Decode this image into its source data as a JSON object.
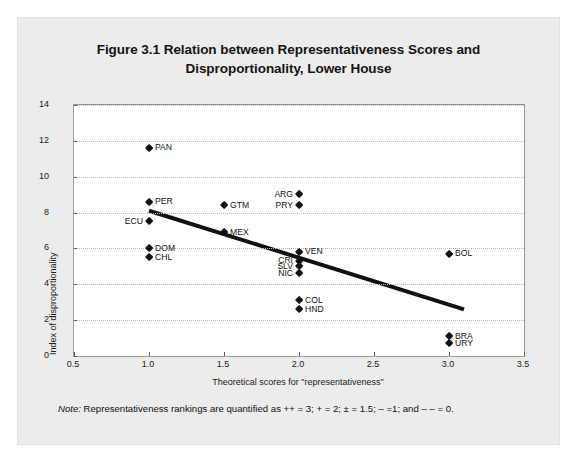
{
  "figure": {
    "title": "Figure 3.1 Relation between Representativeness Scores and Disproportionality, Lower House",
    "title_line1": "Figure 3.1 Relation between Representativeness Scores and",
    "title_line2": "Disproportionality, Lower House",
    "note_label": "Note:",
    "note_text": " Representativeness rankings are quantified as ++ = 3; + = 2; ± = 1.5; – =1; and – – = 0."
  },
  "chart_data": {
    "type": "scatter",
    "title": "Figure 3.1 Relation between Representativeness Scores and Disproportionality, Lower House",
    "xlabel": "Theoretical scores for \"representativeness\"",
    "ylabel": "Index of disproportionality",
    "xlim": [
      0.5,
      3.5
    ],
    "ylim": [
      0,
      14
    ],
    "xticks": [
      "0.5",
      "1.0",
      "1.5",
      "2.0",
      "2.5",
      "3.0",
      "3.5"
    ],
    "xtick_values": [
      0.5,
      1.0,
      1.5,
      2.0,
      2.5,
      3.0,
      3.5
    ],
    "yticks": [
      "0",
      "2",
      "4",
      "6",
      "8",
      "10",
      "12",
      "14"
    ],
    "ytick_values": [
      0,
      2,
      4,
      6,
      8,
      10,
      12,
      14
    ],
    "grid": "horizontal-dotted",
    "legend": "none",
    "points": [
      {
        "label": "PAN",
        "x": 1.0,
        "y": 11.6,
        "label_side": "right"
      },
      {
        "label": "PER",
        "x": 1.0,
        "y": 8.6,
        "label_side": "right"
      },
      {
        "label": "ECU",
        "x": 1.0,
        "y": 7.5,
        "label_side": "left"
      },
      {
        "label": "DOM",
        "x": 1.0,
        "y": 6.0,
        "label_side": "right"
      },
      {
        "label": "CHL",
        "x": 1.0,
        "y": 5.5,
        "label_side": "right"
      },
      {
        "label": "GTM",
        "x": 1.5,
        "y": 8.4,
        "label_side": "right"
      },
      {
        "label": "MEX",
        "x": 1.5,
        "y": 6.9,
        "label_side": "right"
      },
      {
        "label": "ARG",
        "x": 2.0,
        "y": 9.0,
        "label_side": "left"
      },
      {
        "label": "PRY",
        "x": 2.0,
        "y": 8.4,
        "label_side": "left"
      },
      {
        "label": "VEN",
        "x": 2.0,
        "y": 5.8,
        "label_side": "right"
      },
      {
        "label": "CRI",
        "x": 2.0,
        "y": 5.3,
        "label_side": "left"
      },
      {
        "label": "SLV",
        "x": 2.0,
        "y": 5.0,
        "label_side": "left"
      },
      {
        "label": "NIC",
        "x": 2.0,
        "y": 4.6,
        "label_side": "left"
      },
      {
        "label": "COL",
        "x": 2.0,
        "y": 3.1,
        "label_side": "right"
      },
      {
        "label": "HND",
        "x": 2.0,
        "y": 2.6,
        "label_side": "right"
      },
      {
        "label": "BOL",
        "x": 3.0,
        "y": 5.7,
        "label_side": "right"
      },
      {
        "label": "BRA",
        "x": 3.0,
        "y": 1.1,
        "label_side": "right"
      },
      {
        "label": "URY",
        "x": 3.0,
        "y": 0.7,
        "label_side": "right"
      }
    ],
    "trendline": {
      "x0": 1.0,
      "y0": 8.1,
      "x1": 3.1,
      "y1": 2.6,
      "color": "#111111"
    }
  }
}
